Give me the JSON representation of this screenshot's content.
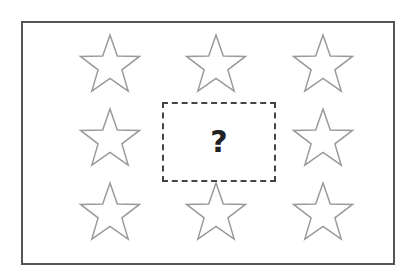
{
  "puzzle": {
    "question_mark": "?",
    "star_color": "#9a9a9a",
    "frame_color": "#555555",
    "box_color": "#444444",
    "stars": [
      {
        "name": "star-r1-c1",
        "x": 78,
        "y": 32
      },
      {
        "name": "star-r1-c2",
        "x": 184,
        "y": 32
      },
      {
        "name": "star-r1-c3",
        "x": 291,
        "y": 32
      },
      {
        "name": "star-r2-c1",
        "x": 78,
        "y": 106
      },
      {
        "name": "star-r2-c3",
        "x": 291,
        "y": 106
      },
      {
        "name": "star-r3-c1",
        "x": 78,
        "y": 180
      },
      {
        "name": "star-r3-c2",
        "x": 184,
        "y": 180
      },
      {
        "name": "star-r3-c3",
        "x": 291,
        "y": 180
      }
    ]
  }
}
